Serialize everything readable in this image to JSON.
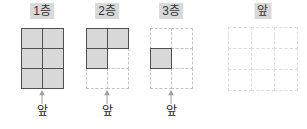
{
  "panels": [
    {
      "label": "1층",
      "front_label": "앞",
      "grid": {
        "cols": 2,
        "rows": 3,
        "dash": "normal",
        "filled": [
          [
            1,
            1
          ],
          [
            1,
            1
          ],
          [
            1,
            1
          ]
        ]
      }
    },
    {
      "label": "2층",
      "front_label": "앞",
      "grid": {
        "cols": 2,
        "rows": 3,
        "dash": "normal",
        "filled": [
          [
            1,
            1
          ],
          [
            1,
            0
          ],
          [
            0,
            0
          ]
        ]
      }
    },
    {
      "label": "3층",
      "front_label": "앞",
      "grid": {
        "cols": 2,
        "rows": 3,
        "dash": "normal",
        "filled": [
          [
            0,
            0
          ],
          [
            1,
            0
          ],
          [
            0,
            0
          ]
        ]
      }
    },
    {
      "label": "앞",
      "grid": {
        "cols": 3,
        "rows": 3,
        "dash": "light",
        "filled": [
          [
            0,
            0,
            0
          ],
          [
            0,
            0,
            0
          ],
          [
            0,
            0,
            0
          ]
        ]
      }
    }
  ],
  "colors": {
    "background": "#ffffff",
    "label_bg": "#d9d9d9",
    "label_text": "#333333",
    "cell_fill": "#d8d8d8",
    "cell_border": "#4f4f4f",
    "dash_border": "#c4c4c4",
    "dash_border_light": "#dcdcdc",
    "arrow": "#a0a0a0",
    "front_text": "#1a1a1a"
  }
}
